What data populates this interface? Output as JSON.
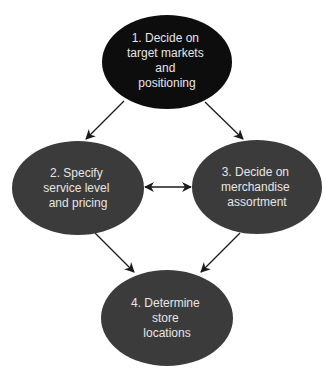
{
  "diagram": {
    "colors": {
      "background": "#ffffff",
      "primary_node": "#0d0d0d",
      "secondary_node": "#3b3b3b",
      "text": "#e6e6e6",
      "arrow": "#1a1a1a"
    },
    "nodes": [
      {
        "id": "n1",
        "lines": [
          "1. Decide on",
          "target markets",
          "and",
          "positioning"
        ]
      },
      {
        "id": "n2",
        "lines": [
          "2. Specify",
          "service level",
          "and pricing"
        ]
      },
      {
        "id": "n3",
        "lines": [
          "3. Decide on",
          "merchandise",
          "assortment"
        ]
      },
      {
        "id": "n4",
        "lines": [
          "4. Determine",
          "store",
          "locations"
        ]
      }
    ],
    "edges": [
      {
        "from": "n1",
        "to": "n2",
        "type": "directed"
      },
      {
        "from": "n1",
        "to": "n3",
        "type": "directed"
      },
      {
        "from": "n2",
        "to": "n3",
        "type": "bidirectional"
      },
      {
        "from": "n2",
        "to": "n4",
        "type": "directed"
      },
      {
        "from": "n3",
        "to": "n4",
        "type": "directed"
      }
    ]
  }
}
